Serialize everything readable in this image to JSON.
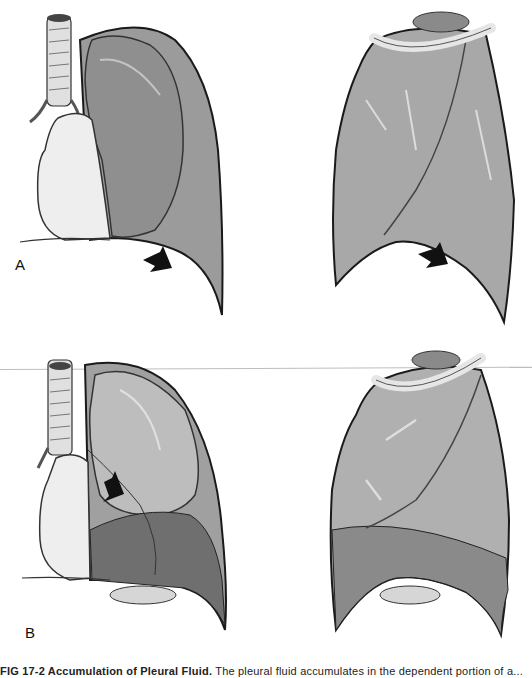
{
  "figure": {
    "type": "medical-illustration",
    "subject": "Accumulation of pleural fluid",
    "panels": [
      {
        "id": "A",
        "label": "A",
        "views": [
          "anterior-lung-view",
          "lateral-lung-view"
        ],
        "arrow": "points-to-costophrenic-angle"
      },
      {
        "id": "B",
        "label": "B",
        "views": [
          "anterior-lung-view-with-effusion",
          "lateral-lung-view-with-effusion"
        ],
        "arrow": "points-to-compressed-lung"
      }
    ],
    "caption": {
      "lead": "FIG 17-2 Accumulation of Pleural Fluid.",
      "text": " The pleural fluid accumulates in the dependent portion of a..."
    },
    "colors": {
      "background": "#ffffff",
      "lung_fill": "#a8a8a8",
      "lung_dark": "#6e6e6e",
      "fluid_fill": "#7c7c7c",
      "heart_fill": "#eeeeee",
      "outline": "#1a1a1a",
      "divider": "#bdbdbd"
    }
  }
}
